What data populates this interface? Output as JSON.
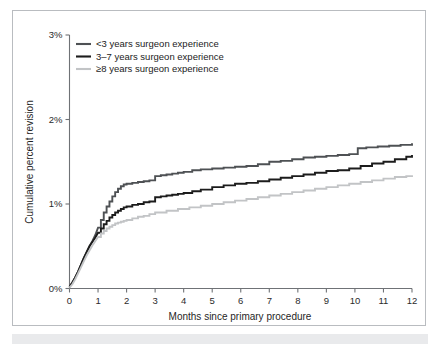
{
  "figure": {
    "frame_border_color": "#b9bcc0",
    "background": "#ffffff",
    "caption_band_color": "#e9eaec"
  },
  "chart_data": {
    "type": "line",
    "title": "",
    "xlabel": "Months since primary procedure",
    "ylabel": "Cumulative percent revision",
    "xlim": [
      0,
      12
    ],
    "ylim": [
      0,
      3
    ],
    "xticks": [
      0,
      1,
      2,
      3,
      4,
      5,
      6,
      7,
      8,
      9,
      10,
      11,
      12
    ],
    "xtick_labels": [
      "0",
      "1",
      "2",
      "3",
      "4",
      "5",
      "6",
      "7",
      "8",
      "9",
      "10",
      "11",
      "12"
    ],
    "yticks": [
      0,
      1,
      2,
      3
    ],
    "ytick_labels": [
      "0%",
      "1%",
      "2%",
      "3%"
    ],
    "grid": false,
    "legend_position": "top-left",
    "step_style": "step-post",
    "series": [
      {
        "name": "<3 years surgeon experience",
        "color": "#4e5154",
        "linewidth": 1.9,
        "x": [
          0,
          0.1,
          0.2,
          0.3,
          0.4,
          0.5,
          0.6,
          0.7,
          0.8,
          0.9,
          1.0,
          1.1,
          1.2,
          1.3,
          1.4,
          1.5,
          1.6,
          1.7,
          1.8,
          1.9,
          2.0,
          2.2,
          2.4,
          2.6,
          2.8,
          3.0,
          3.2,
          3.4,
          3.6,
          3.8,
          4.0,
          4.3,
          4.6,
          5.0,
          5.4,
          5.8,
          6.2,
          6.6,
          7.0,
          7.4,
          7.8,
          8.2,
          8.6,
          9.0,
          9.4,
          9.8,
          10.1,
          10.4,
          10.8,
          11.2,
          11.6,
          12.0
        ],
        "y": [
          0.02,
          0.07,
          0.13,
          0.2,
          0.28,
          0.36,
          0.43,
          0.5,
          0.56,
          0.63,
          0.72,
          0.81,
          0.9,
          0.97,
          1.03,
          1.09,
          1.14,
          1.18,
          1.21,
          1.23,
          1.24,
          1.25,
          1.26,
          1.27,
          1.28,
          1.33,
          1.34,
          1.35,
          1.36,
          1.37,
          1.38,
          1.4,
          1.41,
          1.42,
          1.43,
          1.44,
          1.45,
          1.47,
          1.5,
          1.51,
          1.53,
          1.55,
          1.56,
          1.57,
          1.58,
          1.59,
          1.66,
          1.67,
          1.68,
          1.69,
          1.7,
          1.72
        ]
      },
      {
        "name": "3–7 years surgeon experience",
        "color": "#1c1c1c",
        "linewidth": 1.9,
        "x": [
          0,
          0.1,
          0.2,
          0.3,
          0.4,
          0.5,
          0.6,
          0.7,
          0.8,
          0.9,
          1.0,
          1.1,
          1.2,
          1.3,
          1.4,
          1.5,
          1.6,
          1.7,
          1.8,
          1.9,
          2.0,
          2.2,
          2.4,
          2.6,
          2.8,
          3.0,
          3.2,
          3.4,
          3.6,
          3.8,
          4.0,
          4.3,
          4.6,
          5.0,
          5.4,
          5.8,
          6.2,
          6.6,
          7.0,
          7.4,
          7.8,
          8.2,
          8.6,
          9.0,
          9.4,
          9.8,
          10.2,
          10.6,
          11.0,
          11.4,
          11.8,
          12.0
        ],
        "y": [
          0.02,
          0.07,
          0.13,
          0.2,
          0.28,
          0.36,
          0.43,
          0.5,
          0.55,
          0.6,
          0.66,
          0.71,
          0.76,
          0.8,
          0.84,
          0.87,
          0.9,
          0.92,
          0.94,
          0.96,
          0.97,
          0.99,
          1.0,
          1.02,
          1.03,
          1.08,
          1.09,
          1.1,
          1.11,
          1.12,
          1.13,
          1.15,
          1.17,
          1.2,
          1.22,
          1.24,
          1.25,
          1.27,
          1.29,
          1.31,
          1.33,
          1.35,
          1.37,
          1.39,
          1.4,
          1.42,
          1.45,
          1.48,
          1.5,
          1.53,
          1.56,
          1.58
        ]
      },
      {
        "name": "≥8 years surgeon experience",
        "color": "#c2c4c6",
        "linewidth": 1.9,
        "x": [
          0,
          0.1,
          0.2,
          0.3,
          0.4,
          0.5,
          0.6,
          0.7,
          0.8,
          0.9,
          1.0,
          1.1,
          1.2,
          1.3,
          1.4,
          1.5,
          1.6,
          1.7,
          1.8,
          1.9,
          2.0,
          2.2,
          2.4,
          2.6,
          2.8,
          3.0,
          3.4,
          3.8,
          4.2,
          4.6,
          5.0,
          5.4,
          5.8,
          6.2,
          6.6,
          7.0,
          7.4,
          7.8,
          8.2,
          8.6,
          9.0,
          9.4,
          9.8,
          10.2,
          10.6,
          11.0,
          11.4,
          11.8,
          12.0
        ],
        "y": [
          0.01,
          0.05,
          0.11,
          0.18,
          0.25,
          0.32,
          0.39,
          0.45,
          0.51,
          0.56,
          0.61,
          0.65,
          0.68,
          0.71,
          0.73,
          0.75,
          0.77,
          0.78,
          0.79,
          0.8,
          0.81,
          0.83,
          0.85,
          0.86,
          0.88,
          0.9,
          0.92,
          0.94,
          0.96,
          0.98,
          1.0,
          1.02,
          1.04,
          1.06,
          1.08,
          1.1,
          1.12,
          1.14,
          1.16,
          1.18,
          1.2,
          1.22,
          1.24,
          1.26,
          1.28,
          1.3,
          1.32,
          1.33,
          1.34
        ]
      }
    ],
    "legend": [
      {
        "label": "<3 years surgeon experience",
        "color": "#4e5154"
      },
      {
        "label": "3–7 years surgeon experience",
        "color": "#1c1c1c"
      },
      {
        "label": "≥8 years surgeon experience",
        "color": "#c2c4c6"
      }
    ]
  }
}
